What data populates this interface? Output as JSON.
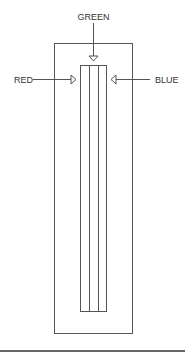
{
  "diagram": {
    "labels": {
      "top": "GREEN",
      "left": "RED",
      "right": "BLUE"
    },
    "strips": 3,
    "colors": {
      "stroke": "#555555",
      "background": "#ffffff"
    }
  }
}
